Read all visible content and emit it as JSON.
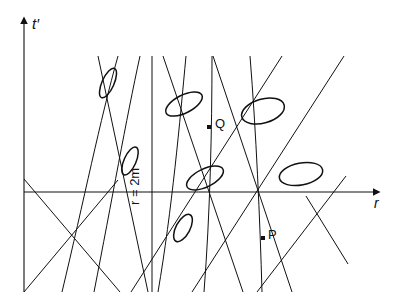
{
  "figure": {
    "kind": "spacetime-diagram"
  },
  "labels": {
    "t_axis": "t′",
    "r_axis": "r",
    "horizon": "r = 2m",
    "point_q": "Q",
    "point_p": "P"
  },
  "colors": {
    "ink": "#111111",
    "background": "#ffffff"
  },
  "chart_data": {
    "type": "line",
    "title": "",
    "xlabel": "r",
    "ylabel": "t′",
    "grid": false,
    "legend": null,
    "axes": {
      "t_axis": {
        "x": 24,
        "y_top": 18,
        "y_bottom": 292,
        "arrow": "up"
      },
      "r_axis": {
        "y": 192,
        "x_left": 24,
        "x_right": 379,
        "arrow": "right"
      },
      "origin": {
        "x": 24,
        "y": 192
      }
    },
    "horizon_line": {
      "label": "r = 2m",
      "x": 152,
      "y_top": 56,
      "y_bottom": 292
    },
    "outgoing_null_curves": [
      {
        "name": "curve-1",
        "path": "M 118,56 C 100,120 84,200 62,292"
      },
      {
        "name": "curve-2",
        "path": "M 140,56 C 126,120 112,200 94,292"
      },
      {
        "name": "curve-3",
        "path": "M 186,56 C 180,120 172,210 158,292"
      },
      {
        "name": "curve-4",
        "path": "M 212,56 C 212,130 210,215 204,292"
      },
      {
        "name": "curve-5",
        "path": "M 250,56 C 256,130 260,220 262,292"
      }
    ],
    "ingoing_null_lines": [
      {
        "name": "null-1",
        "x1": 24,
        "y1": 179,
        "x2": 120,
        "y2": 292
      },
      {
        "name": "null-2",
        "x1": 24,
        "y1": 292,
        "x2": 118,
        "y2": 180
      },
      {
        "name": "null-3",
        "x1": 98,
        "y1": 56,
        "x2": 148,
        "y2": 292
      },
      {
        "name": "null-4",
        "x1": 131,
        "y1": 292,
        "x2": 282,
        "y2": 56
      },
      {
        "name": "null-5",
        "x1": 163,
        "y1": 56,
        "x2": 243,
        "y2": 292
      },
      {
        "name": "null-6",
        "x1": 192,
        "y1": 292,
        "x2": 344,
        "y2": 56
      },
      {
        "name": "null-7",
        "x1": 213,
        "y1": 56,
        "x2": 292,
        "y2": 292
      },
      {
        "name": "null-8",
        "x1": 257,
        "y1": 292,
        "x2": 346,
        "y2": 176
      },
      {
        "name": "null-9",
        "x1": 306,
        "y1": 196,
        "x2": 348,
        "y2": 264
      }
    ],
    "light_cones": [
      {
        "name": "cone-1",
        "cx": 108,
        "cy": 83,
        "rx": 16,
        "ry": 6,
        "rot": -66
      },
      {
        "name": "cone-2",
        "cx": 130,
        "cy": 161,
        "rx": 15,
        "ry": 6,
        "rot": -66
      },
      {
        "name": "cone-3",
        "cx": 183,
        "cy": 228,
        "rx": 15,
        "ry": 7,
        "rot": -62
      },
      {
        "name": "cone-4",
        "cx": 184,
        "cy": 104,
        "rx": 20,
        "ry": 9,
        "rot": -27
      },
      {
        "name": "cone-5",
        "cx": 205,
        "cy": 178,
        "rx": 20,
        "ry": 9,
        "rot": -26
      },
      {
        "name": "cone-6",
        "cx": 263,
        "cy": 111,
        "rx": 22,
        "ry": 12,
        "rot": -16
      },
      {
        "name": "cone-7",
        "cx": 301,
        "cy": 174,
        "rx": 22,
        "ry": 11,
        "rot": -11
      }
    ],
    "marked_points": [
      {
        "name": "point-Q",
        "label": "Q",
        "x": 209,
        "y": 127
      },
      {
        "name": "point-P",
        "label": "P",
        "x": 263,
        "y": 238
      }
    ]
  }
}
